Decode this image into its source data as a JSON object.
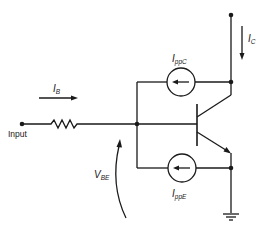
{
  "diagram": {
    "type": "circuit-schematic",
    "labels": {
      "input": "Input",
      "base_current": {
        "main": "I",
        "sub": "B"
      },
      "collector_current": {
        "main": "I",
        "sub": "C"
      },
      "collector_source": {
        "main": "I",
        "sub": "ppC"
      },
      "emitter_source": {
        "main": "I",
        "sub": "ppE"
      },
      "vbe": {
        "main": "V",
        "sub": "BE"
      }
    },
    "components": [
      {
        "id": "input-terminal",
        "kind": "terminal"
      },
      {
        "id": "base-resistor",
        "kind": "resistor"
      },
      {
        "id": "transistor",
        "kind": "npn-bjt"
      },
      {
        "id": "collector-current-source",
        "kind": "current-source",
        "direction": "left"
      },
      {
        "id": "emitter-current-source",
        "kind": "current-source",
        "direction": "left"
      },
      {
        "id": "collector-terminal",
        "kind": "terminal"
      },
      {
        "id": "ground",
        "kind": "ground"
      }
    ],
    "colors": {
      "ink": "#1a1a1a",
      "background": "#ffffff"
    }
  }
}
